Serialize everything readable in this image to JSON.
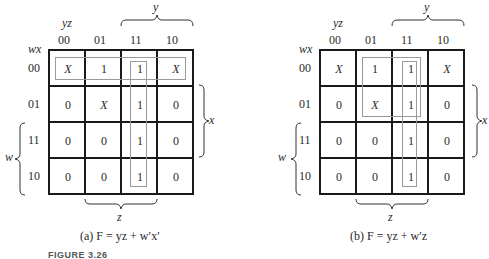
{
  "maps": [
    {
      "id": "a",
      "col_var": "yz",
      "row_var": "wx",
      "col_labels": [
        "00",
        "01",
        "11",
        "10"
      ],
      "row_labels": [
        "00",
        "01",
        "11",
        "10"
      ],
      "cells": [
        [
          "X",
          "1",
          "1",
          "X"
        ],
        [
          "0",
          "X",
          "1",
          "0"
        ],
        [
          "0",
          "0",
          "1",
          "0"
        ],
        [
          "0",
          "0",
          "1",
          "0"
        ]
      ],
      "brace_top": "y",
      "brace_right": "x",
      "brace_left": "w",
      "brace_bottom": "z",
      "caption": "(a)  F = yz + w′x′"
    },
    {
      "id": "b",
      "col_var": "yz",
      "row_var": "wx",
      "col_labels": [
        "00",
        "01",
        "11",
        "10"
      ],
      "row_labels": [
        "00",
        "01",
        "11",
        "10"
      ],
      "cells": [
        [
          "X",
          "1",
          "1",
          "X"
        ],
        [
          "0",
          "X",
          "1",
          "0"
        ],
        [
          "0",
          "0",
          "1",
          "0"
        ],
        [
          "0",
          "0",
          "1",
          "0"
        ]
      ],
      "brace_top": "y",
      "brace_right": "x",
      "brace_left": "w",
      "brace_bottom": "z",
      "caption": "(b)  F = yz + w′z"
    }
  ],
  "figure_label": "FIGURE 3.26"
}
